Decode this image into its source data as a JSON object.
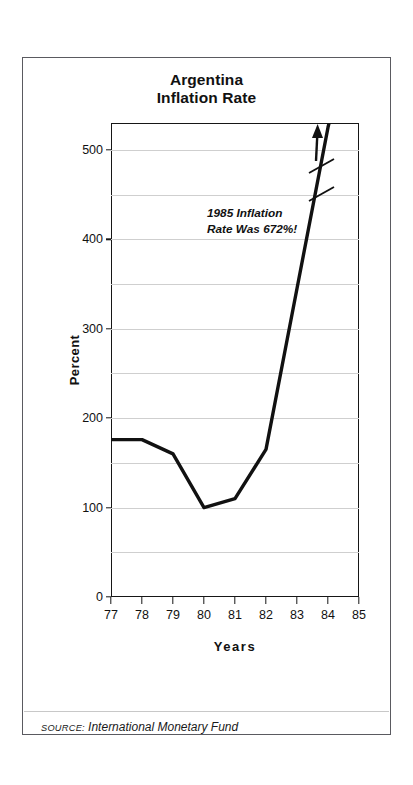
{
  "figure": {
    "title_line1": "Argentina",
    "title_line2": "Inflation Rate",
    "annotation_line1": "1985 Inflation",
    "annotation_line2": "Rate Was 672%!",
    "source_key": "SOURCE:",
    "source_value": "International Monetary Fund",
    "frame_color": "#5a5a60",
    "line_color": "#111111",
    "grid_color": "#cfcfcf"
  },
  "chart_data": {
    "type": "line",
    "title": "Argentina Inflation Rate",
    "xlabel": "Years",
    "ylabel": "Percent",
    "x": [
      "77",
      "78",
      "79",
      "80",
      "81",
      "82",
      "83",
      "84",
      "85"
    ],
    "xtick_labels": [
      "77",
      "78",
      "79",
      "80",
      "81",
      "82",
      "83",
      "84",
      "85"
    ],
    "ytick_labels": [
      "0",
      "100",
      "200",
      "300",
      "400",
      "500"
    ],
    "ytick_values": [
      0,
      100,
      200,
      300,
      400,
      500
    ],
    "gridline_values": [
      50,
      100,
      150,
      200,
      250,
      300,
      350,
      400,
      450,
      500
    ],
    "grid": true,
    "legend": "none",
    "xlim": [
      77,
      85
    ],
    "ylim": [
      0,
      530
    ],
    "series": [
      {
        "name": "Inflation Rate",
        "values": [
          176,
          176,
          160,
          100,
          110,
          165,
          345,
          525,
          672
        ],
        "clipped_above": 530
      }
    ],
    "annotations": [
      {
        "text": "1985 Inflation Rate Was 672%!",
        "note": "axis break on line; arrow points up off chart",
        "value": 672,
        "year": "85"
      }
    ],
    "source": "International Monetary Fund"
  }
}
